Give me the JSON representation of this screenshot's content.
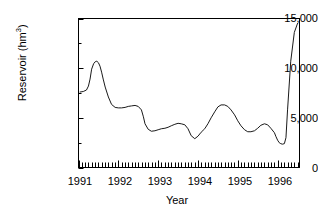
{
  "chart_data": {
    "type": "line",
    "title": "",
    "subtitle": "",
    "xlabel": "Year",
    "ylabel": "Reservoir (hm3)",
    "ylabel_base": "Reservoir (hm",
    "ylabel_sup": "3",
    "ylabel_tail": ")",
    "xlim": [
      1991.0,
      1996.55
    ],
    "ylim": [
      0,
      15000
    ],
    "grid": false,
    "legend": null,
    "y_ticks_major": [
      0,
      5000,
      10000,
      15000
    ],
    "y_ticks_major_labels": [
      "0",
      "5,000",
      "10,000",
      "15,000"
    ],
    "y_ticks_minor": [
      2500,
      7500,
      12500
    ],
    "x_ticks_major": [
      1991,
      1992,
      1993,
      1994,
      1995,
      1996
    ],
    "x_ticks_major_labels": [
      "1991",
      "1992",
      "1993",
      "1994",
      "1995",
      "1996"
    ],
    "x_minor_tick_interval_months": 1,
    "line_color": "#1a1a1a",
    "line_width": 1,
    "series": [
      {
        "name": "Reservoir volume",
        "x": [
          1991.04,
          1991.12,
          1991.2,
          1991.25,
          1991.29,
          1991.33,
          1991.38,
          1991.42,
          1991.46,
          1991.5,
          1991.54,
          1991.58,
          1991.62,
          1991.67,
          1991.75,
          1991.83,
          1991.92,
          1992.0,
          1992.08,
          1992.17,
          1992.25,
          1992.33,
          1992.42,
          1992.5,
          1992.58,
          1992.63,
          1992.67,
          1992.75,
          1992.83,
          1992.92,
          1993.0,
          1993.08,
          1993.17,
          1993.25,
          1993.33,
          1993.42,
          1993.5,
          1993.58,
          1993.67,
          1993.75,
          1993.83,
          1993.92,
          1994.0,
          1994.08,
          1994.17,
          1994.25,
          1994.33,
          1994.42,
          1994.5,
          1994.58,
          1994.67,
          1994.75,
          1994.83,
          1994.92,
          1995.0,
          1995.08,
          1995.17,
          1995.25,
          1995.33,
          1995.42,
          1995.5,
          1995.58,
          1995.67,
          1995.75,
          1995.83,
          1995.92,
          1995.96,
          1996.0,
          1996.04,
          1996.08,
          1996.12,
          1996.17,
          1996.21,
          1996.25,
          1996.33,
          1996.42,
          1996.5
        ],
        "y": [
          7600,
          7650,
          7800,
          8200,
          8900,
          9900,
          10450,
          10650,
          10700,
          10550,
          10200,
          9600,
          8900,
          8100,
          7100,
          6350,
          6050,
          6000,
          6000,
          6050,
          6150,
          6200,
          6250,
          6150,
          5800,
          5100,
          4400,
          3850,
          3650,
          3700,
          3800,
          3900,
          3950,
          4050,
          4200,
          4350,
          4450,
          4400,
          4300,
          3900,
          3200,
          2900,
          3150,
          3550,
          3900,
          4400,
          5000,
          5600,
          6100,
          6300,
          6300,
          6150,
          5800,
          5300,
          4700,
          4200,
          3800,
          3600,
          3600,
          3700,
          3950,
          4250,
          4400,
          4300,
          3950,
          3500,
          3100,
          2750,
          2500,
          2400,
          2350,
          2400,
          3000,
          5800,
          10700,
          13600,
          14500
        ]
      }
    ],
    "annotations": []
  },
  "figure": {
    "background_color": "#ffffff",
    "axis_color": "#000000",
    "text_color": "#000000"
  }
}
